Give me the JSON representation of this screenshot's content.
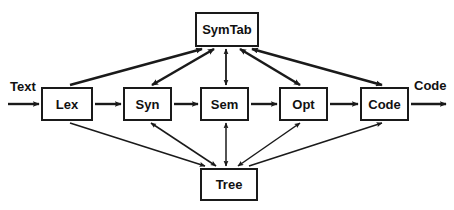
{
  "diagram": {
    "type": "flow-diagram",
    "colors": {
      "stroke": "#1a1a1a",
      "background": "#ffffff",
      "text": "#111111"
    },
    "io_labels": {
      "input": "Text",
      "output": "Code"
    },
    "nodes": [
      {
        "id": "symtab",
        "label": "SymTab",
        "x": 195,
        "y": 12,
        "w": 64,
        "h": 35
      },
      {
        "id": "lex",
        "label": "Lex",
        "x": 41,
        "y": 87,
        "w": 52,
        "h": 34
      },
      {
        "id": "syn",
        "label": "Syn",
        "x": 123,
        "y": 87,
        "w": 49,
        "h": 34
      },
      {
        "id": "sem",
        "label": "Sem",
        "x": 200,
        "y": 87,
        "w": 49,
        "h": 34
      },
      {
        "id": "opt",
        "label": "Opt",
        "x": 279,
        "y": 87,
        "w": 49,
        "h": 34
      },
      {
        "id": "code",
        "label": "Code",
        "x": 360,
        "y": 87,
        "w": 49,
        "h": 34
      },
      {
        "id": "tree",
        "label": "Tree",
        "x": 200,
        "y": 168,
        "w": 58,
        "h": 33
      }
    ],
    "edges": [
      {
        "from": "input",
        "to": "lex",
        "direction": "one-way",
        "weight": "thick"
      },
      {
        "from": "lex",
        "to": "syn",
        "direction": "one-way",
        "weight": "thick"
      },
      {
        "from": "syn",
        "to": "sem",
        "direction": "one-way",
        "weight": "thick"
      },
      {
        "from": "sem",
        "to": "opt",
        "direction": "one-way",
        "weight": "thick"
      },
      {
        "from": "opt",
        "to": "code",
        "direction": "one-way",
        "weight": "thick"
      },
      {
        "from": "code",
        "to": "output",
        "direction": "one-way",
        "weight": "thick"
      },
      {
        "from": "lex",
        "to": "symtab",
        "direction": "one-way",
        "weight": "thick"
      },
      {
        "from": "syn",
        "to": "symtab",
        "direction": "two-way",
        "weight": "thick"
      },
      {
        "from": "sem",
        "to": "symtab",
        "direction": "two-way",
        "weight": "thin"
      },
      {
        "from": "opt",
        "to": "symtab",
        "direction": "two-way",
        "weight": "thick"
      },
      {
        "from": "code",
        "to": "symtab",
        "direction": "two-way",
        "weight": "thick"
      },
      {
        "from": "lex",
        "to": "tree",
        "direction": "one-way",
        "weight": "thin"
      },
      {
        "from": "syn",
        "to": "tree",
        "direction": "two-way",
        "weight": "thin"
      },
      {
        "from": "sem",
        "to": "tree",
        "direction": "two-way",
        "weight": "thin"
      },
      {
        "from": "opt",
        "to": "tree",
        "direction": "two-way",
        "weight": "thin"
      },
      {
        "from": "tree",
        "to": "code",
        "direction": "one-way",
        "weight": "thin"
      }
    ]
  }
}
